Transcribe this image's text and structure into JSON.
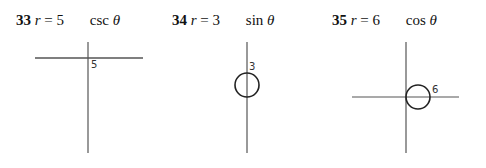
{
  "problems": [
    {
      "number": "33",
      "var": "r",
      "eq": " = ",
      "coef": "5",
      "func": "csc",
      "theta": "θ",
      "graph_label": "5",
      "description": "Horizontal line y = 5 (r = 5 csc θ)"
    },
    {
      "number": "34",
      "var": "r",
      "eq": " = ",
      "coef": "3",
      "func": "sin",
      "theta": "θ",
      "graph_label": "3",
      "description": "Circle of diameter 3 centered on the vertical axis (r = 3 sin θ)"
    },
    {
      "number": "35",
      "var": "r",
      "eq": " = ",
      "coef": "6",
      "func": "cos",
      "theta": "θ",
      "graph_label": "6",
      "description": "Circle of diameter 6 centered on the horizontal axis (r = 6 cos θ)"
    }
  ]
}
